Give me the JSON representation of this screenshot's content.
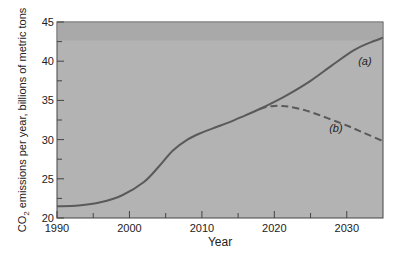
{
  "chart_data": {
    "type": "line",
    "title": "",
    "xlabel": "Year",
    "ylabel": "CO2 emissions per year, billions of metric tons",
    "ylabel_parts": {
      "pre": "CO",
      "sub": "2",
      "post": " emissions per year, billions of metric tons"
    },
    "xlim": [
      1990,
      2035
    ],
    "ylim": [
      20,
      45
    ],
    "x_ticks": [
      1990,
      2000,
      2010,
      2020,
      2030
    ],
    "y_ticks": [
      20,
      25,
      30,
      35,
      40,
      45
    ],
    "minor_x_ticks": [
      1995,
      2005,
      2015,
      2025
    ],
    "minor_y_ticks": [
      22.5,
      27.5,
      32.5,
      37.5,
      42.5
    ],
    "grid": false,
    "legend": "none (inline labels)",
    "series": [
      {
        "name": "(a)",
        "style": "solid",
        "x": [
          1990,
          1993,
          1996,
          1999,
          2002,
          2004,
          2006,
          2008,
          2010,
          2012,
          2014,
          2016,
          2018,
          2020,
          2022,
          2025,
          2028,
          2031,
          2033,
          2035
        ],
        "y": [
          21.5,
          21.6,
          22.0,
          22.9,
          24.6,
          26.5,
          28.6,
          30.0,
          30.9,
          31.6,
          32.3,
          33.1,
          33.9,
          34.8,
          35.8,
          37.5,
          39.5,
          41.4,
          42.3,
          43.0
        ]
      },
      {
        "name": "(b)",
        "style": "dashed",
        "x": [
          2018,
          2019,
          2020,
          2021,
          2022,
          2024,
          2026,
          2028,
          2030,
          2032,
          2035
        ],
        "y": [
          33.9,
          34.2,
          34.3,
          34.3,
          34.2,
          33.8,
          33.2,
          32.5,
          31.8,
          31.0,
          29.8
        ]
      }
    ],
    "annotations": [
      {
        "text": "(a)",
        "x": 2032.5,
        "y": 39.5
      },
      {
        "text": "(b)",
        "x": 2028.5,
        "y": 31.0
      }
    ]
  },
  "colors": {
    "plot_bg": "#b3b3b3",
    "plot_bg_top": "#a9a9a9",
    "line": "#5a5a5a",
    "axis": "#444444"
  }
}
